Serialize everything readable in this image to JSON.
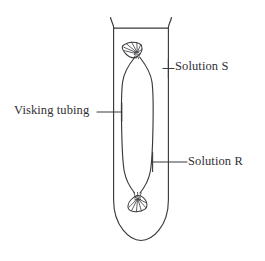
{
  "figure": {
    "type": "diagram",
    "background_color": "#ffffff",
    "line_color": "#3a3a3e",
    "text_color": "#2f2f33"
  },
  "labels": {
    "solution_s": "Solution S",
    "solution_r": "Solution R",
    "visking_tubing": "Visking tubing"
  },
  "parts": {
    "test_tube": "test-tube",
    "test_tube_rim": "test-tube-rim",
    "visking_tubing_bag": "visking-tubing-bag",
    "top_knot": "top-knot",
    "bottom_knot": "bottom-knot",
    "leader_solution_s": "leader-line-solution-s",
    "leader_solution_r": "leader-line-solution-r",
    "leader_visking_tubing": "leader-line-visking-tubing"
  }
}
